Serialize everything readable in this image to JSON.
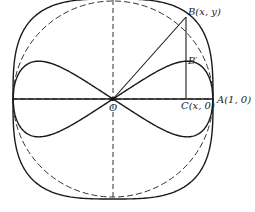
{
  "figure": {
    "colors": {
      "stroke": "#1a1a1a",
      "dashed": "#333333",
      "background": "#ffffff"
    },
    "geometry": {
      "origin_px": [
        113,
        99
      ],
      "radius_px": 100
    }
  },
  "labels": {
    "B": "B(x, y)",
    "B_prime": "B′",
    "C": "C(x, 0)",
    "A": "A(1, 0)",
    "O": "O"
  },
  "elements": {
    "circle": "dashed unit circle",
    "outer_curve": "solid outer curve",
    "inner_curve": "solid figure-eight curve",
    "axes": "dashed coordinate axes",
    "segment_OB": "line from O to B",
    "segment_BC": "vertical line from B to C"
  }
}
